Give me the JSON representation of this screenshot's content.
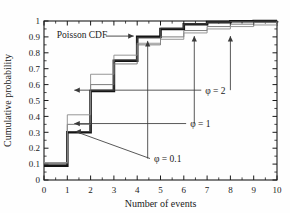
{
  "chart_data": {
    "type": "line",
    "title": "",
    "xlabel": "Number of events",
    "ylabel": "Cumulative probability",
    "xlim": [
      0,
      10
    ],
    "ylim": [
      0,
      1
    ],
    "xticks": [
      "0",
      "1",
      "2",
      "3",
      "4",
      "5",
      "6",
      "7",
      "8",
      "9",
      "10"
    ],
    "yticks": [
      "0",
      "0.1",
      "0.2",
      "0.3",
      "0.4",
      "0.5",
      "0.6",
      "0.7",
      "0.8",
      "0.9",
      "1"
    ],
    "grid": false,
    "legend_position": "inline-annotations",
    "step_style": "post",
    "x": [
      0,
      1,
      2,
      3,
      4,
      5,
      6,
      7,
      8,
      9,
      10
    ],
    "series": [
      {
        "name": "Poisson CDF",
        "style": "thick-black",
        "color": "#141414",
        "width": 2.6,
        "values": [
          0.09,
          0.3,
          0.56,
          0.75,
          0.9,
          0.95,
          0.98,
          0.993,
          0.998,
          0.999,
          1.0
        ]
      },
      {
        "name": "phi = 0.1",
        "style": "thin-dark",
        "color": "#4a4a4a",
        "width": 0.9,
        "values": [
          0.1,
          0.305,
          0.565,
          0.755,
          0.895,
          0.955,
          0.982,
          0.993,
          0.997,
          0.999,
          1.0
        ]
      },
      {
        "name": "phi = 1",
        "style": "thin-mid",
        "color": "#6e6e6e",
        "width": 0.9,
        "values": [
          0.105,
          0.35,
          0.6,
          0.73,
          0.85,
          0.9,
          0.94,
          0.965,
          0.98,
          0.99,
          1.0
        ]
      },
      {
        "name": "phi = 2",
        "style": "thin-light",
        "color": "#8a8a8a",
        "width": 0.9,
        "values": [
          0.11,
          0.41,
          0.665,
          0.785,
          0.86,
          0.885,
          0.925,
          0.95,
          0.965,
          0.975,
          0.99
        ]
      }
    ],
    "annotations": [
      {
        "id": "poisson-cdf-label",
        "text": "Poisson CDF",
        "x": 0.55,
        "y": 0.915,
        "arrow_to_x": 3.85,
        "arrow_to_y": 0.905,
        "arrow": "right"
      },
      {
        "id": "phi-2-label",
        "text": "φ = 2",
        "x": 6.75,
        "y": 0.565,
        "leader_to_x": 1.3,
        "leader_to_y": 0.565,
        "arrow": "left",
        "stem_to_x": 8.0,
        "stem_to_y": 0.905,
        "stem_arrow": "up"
      },
      {
        "id": "phi-1-label",
        "text": "φ = 1",
        "x": 6.1,
        "y": 0.355,
        "leader_to_x": 1.3,
        "leader_to_y": 0.355,
        "arrow": "left",
        "stem_to_x": 6.45,
        "stem_to_y": 0.905,
        "stem_arrow": "up"
      },
      {
        "id": "phi-0p1-label",
        "text": "φ = 0.1",
        "x": 4.55,
        "y": 0.135,
        "leader_to_x": 1.35,
        "leader_to_y": 0.305,
        "arrow": "left",
        "stem_to_x": 4.45,
        "stem_to_y": 0.875,
        "stem_arrow": "up"
      }
    ]
  },
  "axes": {
    "xlabel": "Number of events",
    "ylabel": "Cumulative probability"
  }
}
